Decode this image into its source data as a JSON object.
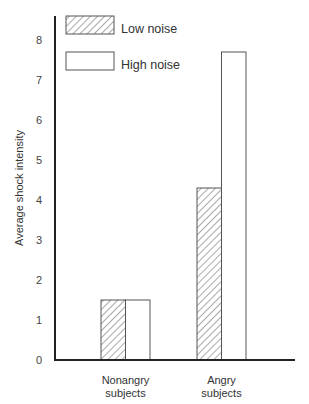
{
  "chart_data": {
    "type": "bar",
    "title": "",
    "xlabel": "",
    "ylabel": "Average shock intensity",
    "categories": [
      "Nonangry subjects",
      "Angry subjects"
    ],
    "category_lines": [
      [
        "Nonangry",
        "subjects"
      ],
      [
        "Angry",
        "subjects"
      ]
    ],
    "series": [
      {
        "name": "Low noise",
        "pattern": "hatched",
        "values": [
          1.5,
          4.3
        ]
      },
      {
        "name": "High noise",
        "pattern": "white",
        "values": [
          1.5,
          7.7
        ]
      }
    ],
    "ylim": [
      0,
      8.5
    ],
    "yticks": [
      0,
      1,
      2,
      3,
      4,
      5,
      6,
      7,
      8
    ],
    "grid": false,
    "legend_position": "top-left inside",
    "colors": {
      "axis": "#222222",
      "bar_edge": "#555555",
      "hatch": "#555555",
      "fill": "#ffffff"
    }
  }
}
